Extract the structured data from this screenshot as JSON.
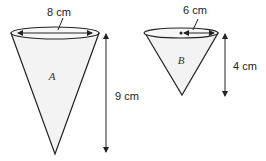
{
  "diagram": {
    "top_partial_text": "…",
    "cone_a": {
      "label": "A",
      "diameter_label": "8 cm",
      "height_label": "9 cm"
    },
    "cone_b": {
      "label": "B",
      "radius_label": "6 cm",
      "height_label": "4 cm"
    },
    "colors": {
      "stroke": "#222222",
      "fill": "#f2f2f2",
      "background": "#ffffff"
    }
  }
}
